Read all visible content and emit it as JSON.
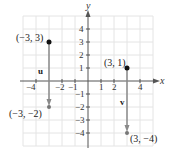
{
  "diagram": {
    "type": "coordinate-plane-vectors",
    "axes": {
      "x_label": "x",
      "y_label": "y",
      "x_range": [
        -4,
        4
      ],
      "y_range": [
        -4,
        4
      ]
    },
    "x_ticks": [
      "−4",
      "−2",
      "−1",
      "1",
      "2",
      "4"
    ],
    "y_ticks": [
      "4",
      "3",
      "2",
      "1",
      "−1",
      "−2",
      "−3",
      "−4"
    ],
    "vectors": [
      {
        "name": "u",
        "start": "(−3, 3)",
        "end": "(−3, −2)"
      },
      {
        "name": "v",
        "start": "(3, 1)",
        "end": "(3, −4)"
      }
    ],
    "colors": {
      "grid": "#e4e4e4",
      "axis": "#555555",
      "vector": "#8a8a8a",
      "point": "#111111"
    }
  }
}
